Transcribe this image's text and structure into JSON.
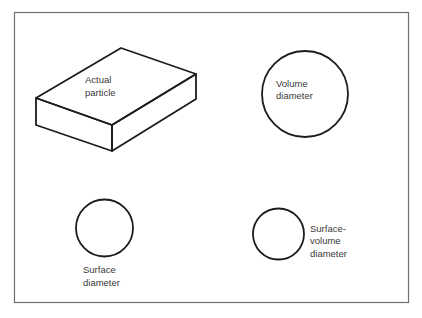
{
  "diagram": {
    "frame": {
      "x": 14,
      "y": 12,
      "width": 394,
      "height": 290,
      "stroke": "#6e6e6e"
    },
    "ink_color": "#1c1c1c",
    "text_color": "#3a3a3a",
    "shapes": [
      {
        "id": "actual-particle",
        "type": "rectangular-prism",
        "label_lines": [
          "Actual",
          "particle"
        ]
      },
      {
        "id": "volume-diameter",
        "type": "circle",
        "label_lines": [
          "Volume",
          "diameter"
        ]
      },
      {
        "id": "surface-diameter",
        "type": "circle",
        "label_lines": [
          "Surface",
          "diameter"
        ]
      },
      {
        "id": "surface-volume-diameter",
        "type": "circle",
        "label_lines": [
          "Surface-",
          "volume",
          "diameter"
        ]
      }
    ]
  }
}
